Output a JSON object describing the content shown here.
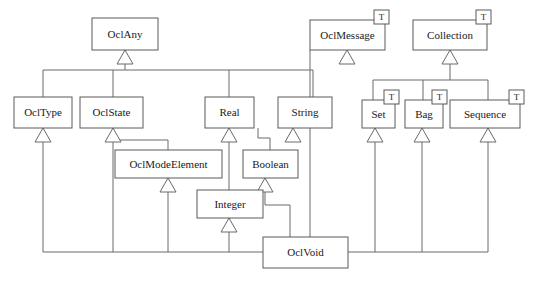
{
  "diagram": {
    "kind": "uml-class-diagram",
    "colors": {
      "background": "#ffffff",
      "box_fill": "#ffffff",
      "box_stroke": "#5a5a5a",
      "line_stroke": "#6a6a6a",
      "text": "#1a1a1a"
    },
    "template_marker_label": "T",
    "classes": [
      {
        "id": "oclany",
        "label": "OclAny",
        "x": 92,
        "y": 18,
        "w": 66,
        "h": 32,
        "template": false
      },
      {
        "id": "ocltype",
        "label": "OclType",
        "x": 14,
        "y": 97,
        "w": 58,
        "h": 31,
        "template": false
      },
      {
        "id": "oclstate",
        "label": "OclState",
        "x": 80,
        "y": 97,
        "w": 63,
        "h": 31,
        "template": false
      },
      {
        "id": "real",
        "label": "Real",
        "x": 205,
        "y": 97,
        "w": 49,
        "h": 31,
        "template": false
      },
      {
        "id": "string",
        "label": "String",
        "x": 278,
        "y": 97,
        "w": 54,
        "h": 31,
        "template": false
      },
      {
        "id": "oclmessage",
        "label": "OclMessage",
        "x": 310,
        "y": 20,
        "w": 75,
        "h": 30,
        "template": true
      },
      {
        "id": "collection",
        "label": "Collection",
        "x": 413,
        "y": 20,
        "w": 74,
        "h": 30,
        "template": true
      },
      {
        "id": "set",
        "label": "Set",
        "x": 362,
        "y": 100,
        "w": 33,
        "h": 28,
        "template": true
      },
      {
        "id": "bag",
        "label": "Bag",
        "x": 405,
        "y": 100,
        "w": 38,
        "h": 28,
        "template": true
      },
      {
        "id": "sequence",
        "label": "Sequence",
        "x": 450,
        "y": 100,
        "w": 70,
        "h": 28,
        "template": true
      },
      {
        "id": "oclmodeelement",
        "label": "OclModeElement",
        "x": 115,
        "y": 150,
        "w": 107,
        "h": 28,
        "template": false
      },
      {
        "id": "boolean",
        "label": "Boolean",
        "x": 243,
        "y": 150,
        "w": 55,
        "h": 28,
        "template": false
      },
      {
        "id": "integer",
        "label": "Integer",
        "x": 197,
        "y": 190,
        "w": 66,
        "h": 28,
        "template": false
      },
      {
        "id": "oclvoid",
        "label": "OclVoid",
        "x": 263,
        "y": 237,
        "w": 85,
        "h": 31,
        "template": false
      }
    ],
    "generalizations": [
      {
        "child": "ocltype",
        "parent": "oclany"
      },
      {
        "child": "oclstate",
        "parent": "oclany"
      },
      {
        "child": "real",
        "parent": "oclany"
      },
      {
        "child": "string",
        "parent": "oclany"
      },
      {
        "child": "oclmodeelement",
        "parent": "oclstate"
      },
      {
        "child": "integer",
        "parent": "real"
      },
      {
        "child": "boolean",
        "parent": "string"
      },
      {
        "child": "set",
        "parent": "collection"
      },
      {
        "child": "bag",
        "parent": "collection"
      },
      {
        "child": "sequence",
        "parent": "collection"
      },
      {
        "child": "oclvoid",
        "parent": "ocltype"
      },
      {
        "child": "oclvoid",
        "parent": "oclstate"
      },
      {
        "child": "oclvoid",
        "parent": "oclmodeelement"
      },
      {
        "child": "oclvoid",
        "parent": "integer"
      },
      {
        "child": "oclvoid",
        "parent": "boolean"
      },
      {
        "child": "oclvoid",
        "parent": "oclmessage"
      },
      {
        "child": "oclvoid",
        "parent": "set"
      },
      {
        "child": "oclvoid",
        "parent": "bag"
      },
      {
        "child": "oclvoid",
        "parent": "sequence"
      }
    ]
  }
}
